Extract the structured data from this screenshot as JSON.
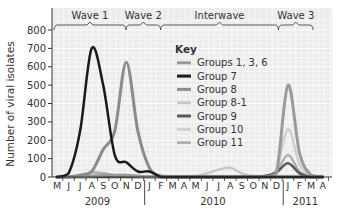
{
  "chart_data": {
    "type": "line",
    "title": "",
    "xlabel": "",
    "ylabel": "Number of viral isolates",
    "ylim": [
      0,
      850
    ],
    "yticks": [
      0,
      100,
      200,
      300,
      400,
      500,
      600,
      700,
      800
    ],
    "grid": true,
    "legend_title": "Key",
    "legend_position": "upper-right inside",
    "x": [
      "M",
      "J",
      "J",
      "A",
      "S",
      "O",
      "N",
      "D",
      "J",
      "F",
      "M",
      "A",
      "M",
      "J",
      "J",
      "A",
      "S",
      "O",
      "N",
      "D",
      "J",
      "F",
      "M",
      "A"
    ],
    "year_labels": [
      {
        "label": "2009",
        "center_index": 3.5
      },
      {
        "label": "2010",
        "center_index": 13.5
      },
      {
        "label": "2011",
        "center_index": 21.5
      }
    ],
    "periods": [
      {
        "label": "Wave 1",
        "start": 0,
        "end": 6.3
      },
      {
        "label": "Wave 2",
        "start": 6.3,
        "end": 9.3
      },
      {
        "label": "Interwave",
        "start": 9.3,
        "end": 19.5
      },
      {
        "label": "Wave 3",
        "start": 19.5,
        "end": 22.5
      }
    ],
    "series": [
      {
        "name": "Groups 1, 3, 6",
        "color": "#9a9a9a",
        "width": 3,
        "values": [
          0,
          0,
          0,
          5,
          10,
          10,
          10,
          5,
          0,
          0,
          0,
          0,
          0,
          0,
          0,
          0,
          0,
          0,
          0,
          20,
          500,
          130,
          10,
          0
        ]
      },
      {
        "name": "Group 7",
        "color": "#1a1a1a",
        "width": 2.5,
        "values": [
          0,
          20,
          250,
          700,
          500,
          120,
          80,
          30,
          30,
          0,
          0,
          0,
          0,
          0,
          0,
          0,
          0,
          0,
          0,
          0,
          0,
          0,
          0,
          0
        ]
      },
      {
        "name": "Group 8",
        "color": "#8c8c8c",
        "width": 3,
        "values": [
          0,
          0,
          10,
          30,
          150,
          250,
          625,
          250,
          50,
          5,
          0,
          0,
          0,
          0,
          0,
          0,
          0,
          0,
          0,
          0,
          0,
          0,
          0,
          0
        ]
      },
      {
        "name": "Group 8-1",
        "color": "#c8c8c8",
        "width": 2.5,
        "values": [
          0,
          0,
          0,
          0,
          0,
          0,
          0,
          0,
          0,
          0,
          0,
          0,
          5,
          20,
          40,
          50,
          20,
          5,
          0,
          0,
          0,
          0,
          0,
          0
        ]
      },
      {
        "name": "Group 9",
        "color": "#5a5a5a",
        "width": 2.5,
        "values": [
          0,
          0,
          0,
          0,
          0,
          0,
          0,
          0,
          0,
          0,
          0,
          0,
          0,
          0,
          0,
          0,
          0,
          0,
          5,
          25,
          75,
          20,
          0,
          0
        ]
      },
      {
        "name": "Group 10",
        "color": "#d0d0d0",
        "width": 2.5,
        "values": [
          0,
          0,
          0,
          0,
          0,
          0,
          0,
          0,
          0,
          0,
          0,
          0,
          0,
          0,
          0,
          0,
          0,
          0,
          5,
          40,
          260,
          70,
          5,
          0
        ]
      },
      {
        "name": "Group 11",
        "color": "#b0b0b0",
        "width": 2.5,
        "values": [
          0,
          0,
          10,
          25,
          20,
          10,
          5,
          0,
          0,
          0,
          0,
          0,
          0,
          0,
          0,
          0,
          0,
          0,
          0,
          30,
          120,
          30,
          0,
          0
        ]
      }
    ]
  }
}
